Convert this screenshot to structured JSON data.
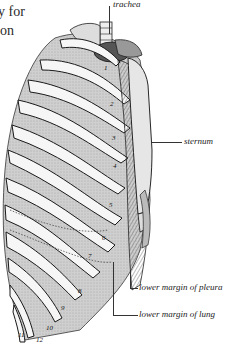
{
  "page": {
    "body_text_lines": [
      "y for",
      "on"
    ]
  },
  "figure": {
    "labels": {
      "trachea": "trachea",
      "sternum": "sternum",
      "pleura": "lower margin of pleura",
      "lung": "lower margin of lung"
    },
    "rib_numbers": [
      "1",
      "2",
      "3",
      "4",
      "5",
      "6",
      "7",
      "8",
      "9",
      "10",
      "11",
      "12"
    ]
  }
}
